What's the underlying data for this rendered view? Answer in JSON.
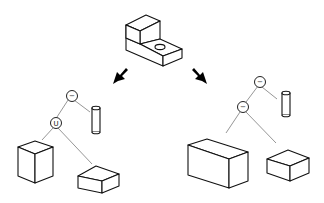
{
  "diagram": {
    "type": "csg-decomposition",
    "source_solid": "l-shaped-block-with-hole",
    "arrows": [
      "down-left",
      "down-right"
    ],
    "trees": [
      {
        "id": "left",
        "root": {
          "op": "−",
          "children": [
            "union-node",
            "cylinder"
          ]
        },
        "union_node": {
          "op": "U",
          "children": [
            "tall-box",
            "flat-box"
          ]
        }
      },
      {
        "id": "right",
        "root": {
          "op": "−",
          "children": [
            "difference-node",
            "cylinder"
          ]
        },
        "difference_node": {
          "op": "−",
          "children": [
            "long-box",
            "small-box"
          ]
        }
      }
    ],
    "labels": {
      "left_root_op": "−",
      "left_union_op": "U",
      "right_root_op": "−",
      "right_inner_op": "−"
    },
    "colors": {
      "line": "#111111",
      "edge": "#8a8a8a",
      "background": "#ffffff"
    }
  }
}
